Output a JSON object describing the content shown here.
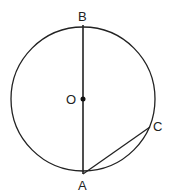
{
  "diagram": {
    "type": "circle-geometry",
    "points": {
      "B": {
        "label": "B",
        "role": "top end of diameter"
      },
      "O": {
        "label": "O",
        "role": "center"
      },
      "A": {
        "label": "A",
        "role": "bottom end of diameter"
      },
      "C": {
        "label": "C",
        "role": "point on circle"
      }
    },
    "segments": [
      "AB (diameter)",
      "AC (chord)"
    ],
    "colors": {
      "stroke": "#222222",
      "background": "#ffffff"
    }
  }
}
